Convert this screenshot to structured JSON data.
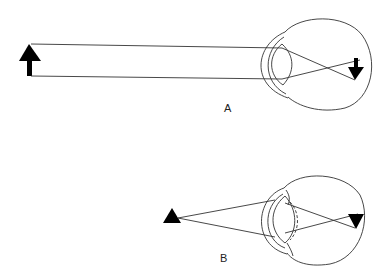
{
  "diagram": {
    "panels": [
      {
        "label": "A",
        "description": "Unaccommodated eye viewing distant object; parallel rays focused on retina, image inverted"
      },
      {
        "label": "B",
        "description": "Accommodated eye viewing near object; lens thickens (dashed outline shows relaxed shape), diverging rays focused on retina, image inverted"
      }
    ],
    "colors": {
      "line": "#333333",
      "fill": "#000000",
      "background": "#ffffff"
    }
  }
}
